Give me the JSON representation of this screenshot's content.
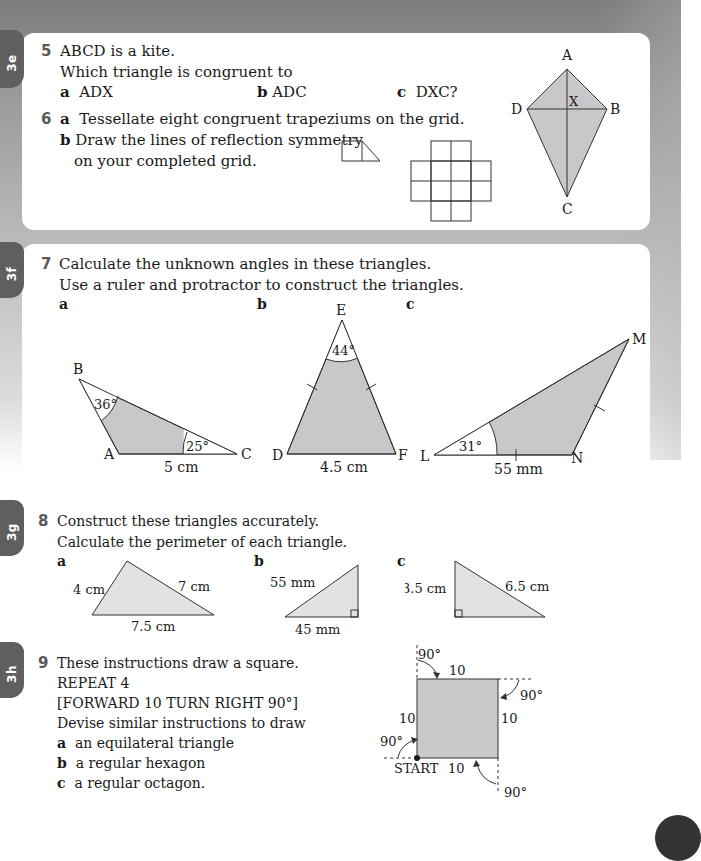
{
  "tabs": {
    "t3e": "3e",
    "t3f": "3f",
    "t3g": "3g",
    "t3h": "3h"
  },
  "q5": {
    "number": "5",
    "line1": "ABCD is a kite.",
    "line2": "Which triangle is congruent to",
    "parts": [
      {
        "label": "a",
        "text": "ADX"
      },
      {
        "label": "b",
        "text": "ADC"
      },
      {
        "label": "c",
        "text": "DXC?"
      }
    ],
    "kite_labels": {
      "A": "A",
      "B": "B",
      "C": "C",
      "D": "D",
      "X": "X"
    }
  },
  "q6": {
    "number": "6",
    "a_label": "a",
    "a_text": "Tessellate eight congruent trapeziums on the grid.",
    "b_label": "b",
    "b_text_line1": "Draw the lines of reflection symmetry",
    "b_text_line2": "on your completed grid."
  },
  "q7": {
    "number": "7",
    "line1": "Calculate the unknown angles in these triangles.",
    "line2": "Use a ruler and protractor to construct the triangles.",
    "a": {
      "label": "a",
      "vA": "A",
      "vB": "B",
      "vC": "C",
      "angleB": "36°",
      "angleC": "25°",
      "side": "5 cm"
    },
    "b": {
      "label": "b",
      "vD": "D",
      "vE": "E",
      "vF": "F",
      "angleE": "44°",
      "side": "4.5 cm"
    },
    "c": {
      "label": "c",
      "vL": "L",
      "vM": "M",
      "vN": "N",
      "angleL": "31°",
      "side": "55 mm"
    }
  },
  "q8": {
    "number": "8",
    "line1": "Construct these triangles accurately.",
    "line2": "Calculate the perimeter of each triangle.",
    "a": {
      "label": "a",
      "left": "4 cm",
      "right": "7 cm",
      "base": "7.5 cm"
    },
    "b": {
      "label": "b",
      "hyp": "55 mm",
      "base": "45 mm"
    },
    "c": {
      "label": "c",
      "left": "3.5 cm",
      "hyp": "6.5 cm"
    }
  },
  "q9": {
    "number": "9",
    "line1": "These instructions draw a square.",
    "line2": "REPEAT 4",
    "line3": "[FORWARD 10 TURN RIGHT 90°]",
    "line4": "Devise similar instructions to draw",
    "parts": [
      {
        "label": "a",
        "text": "an equilateral triangle"
      },
      {
        "label": "b",
        "text": "a regular hexagon"
      },
      {
        "label": "c",
        "text": "a regular octagon."
      }
    ],
    "diagram": {
      "side_top": "10",
      "side_left": "10",
      "side_right": "10",
      "side_bottom": "10",
      "angle": "90°",
      "start": "START"
    }
  },
  "colors": {
    "shape_fill": "#c8c8c8",
    "shape_fill_light": "#e2e2e2",
    "tab": "#5f5f5f",
    "qnum": "#5a5a5a"
  }
}
